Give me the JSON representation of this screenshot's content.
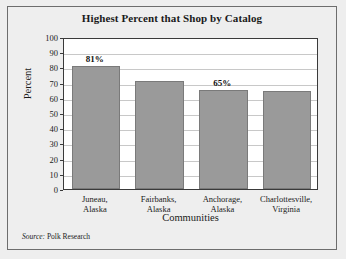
{
  "chart_data": {
    "type": "bar",
    "title": "Highest Percent that Shop by Catalog",
    "xlabel": "Communities",
    "ylabel": "Percent",
    "categories": [
      "Juneau,\nAlaska",
      "Fairbanks,\nAlaska",
      "Anchorage,\nAlaska",
      "Charlottesville,\nVirginia"
    ],
    "category_lines": [
      [
        "Juneau,",
        "Alaska"
      ],
      [
        "Fairbanks,",
        "Alaska"
      ],
      [
        "Anchorage,",
        "Alaska"
      ],
      [
        "Charlottesville,",
        "Virginia"
      ]
    ],
    "values": [
      81,
      71,
      65,
      64.5
    ],
    "point_labels": [
      "81%",
      "",
      "65%",
      ""
    ],
    "ylim": [
      0,
      100
    ],
    "yticks": [
      100,
      90,
      80,
      70,
      60,
      50,
      40,
      30,
      20,
      10,
      0
    ],
    "ytick_labels": [
      "100",
      "90",
      "80",
      "70",
      "60",
      "50",
      "40",
      "30",
      "20",
      "10",
      "0"
    ],
    "grid": true,
    "legend": "none",
    "bar_color": "#9a9a9a",
    "bar_edge_color": "#7a7a7a",
    "plot_background": "#ffffff",
    "page_background": "#eeeeee",
    "axis_color": "#3a3a3a",
    "grid_color": "#c8c8c8"
  },
  "source": {
    "label": "Source:",
    "text": " Polk Research"
  }
}
